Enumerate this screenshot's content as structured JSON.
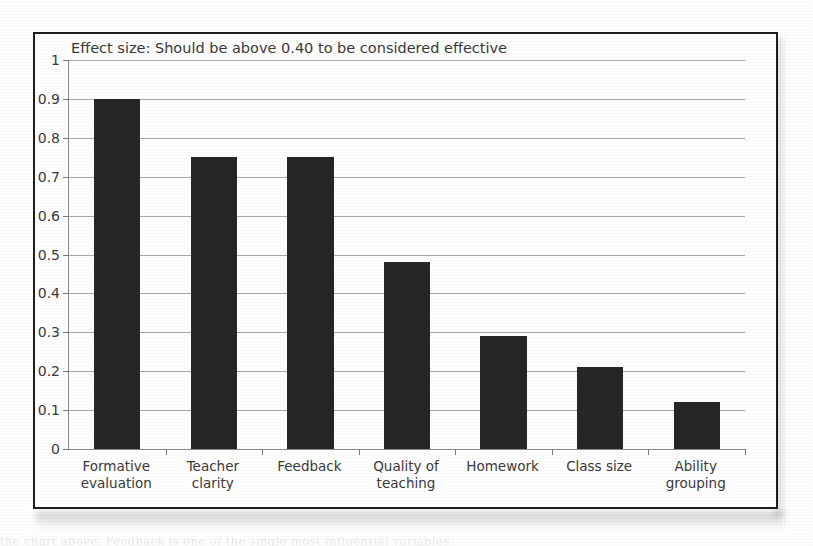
{
  "figure": {
    "title": "Effect size: Should be above 0.40 to be considered effective",
    "bleed_text": "the chart above. Feedback is one of the single most influential variables"
  },
  "chart_data": {
    "type": "bar",
    "title": "Effect size: Should be above 0.40 to be considered effective",
    "xlabel": "",
    "ylabel": "",
    "ylim": [
      0,
      1
    ],
    "grid": true,
    "legend": false,
    "bar_color": "#262626",
    "categories": [
      "Formative evaluation",
      "Teacher clarity",
      "Feedback",
      "Quality of teaching",
      "Homework",
      "Class size",
      "Ability grouping"
    ],
    "category_lines": [
      [
        "Formative",
        "evaluation"
      ],
      [
        "Teacher",
        "clarity"
      ],
      [
        "Feedback"
      ],
      [
        "Quality of",
        "teaching"
      ],
      [
        "Homework"
      ],
      [
        "Class size"
      ],
      [
        "Ability",
        "grouping"
      ]
    ],
    "values": [
      0.9,
      0.75,
      0.75,
      0.48,
      0.29,
      0.21,
      0.12
    ],
    "yticks": [
      0,
      0.1,
      0.2,
      0.3,
      0.4,
      0.5,
      0.6,
      0.7,
      0.8,
      0.9,
      1
    ],
    "ytick_labels": [
      "0",
      "0.1",
      "0.2",
      "0.3",
      "0.4",
      "0.5",
      "0.6",
      "0.7",
      "0.8",
      "0.9",
      "1"
    ],
    "threshold": 0.4
  }
}
